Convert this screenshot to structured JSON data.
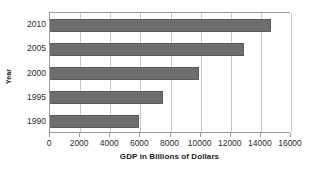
{
  "chart_data": {
    "type": "bar",
    "orientation": "horizontal",
    "title": "",
    "xlabel": "GDP in Billions of Dollars",
    "ylabel": "Year",
    "categories": [
      "2010",
      "2005",
      "2000",
      "1995",
      "1990"
    ],
    "values": [
      14700,
      12850,
      9900,
      7500,
      5900
    ],
    "series": [
      {
        "name": "GDP",
        "values": [
          14700,
          12850,
          9900,
          7500,
          5900
        ]
      }
    ],
    "xlim": [
      0,
      16000
    ],
    "xticks": [
      0,
      2000,
      4000,
      6000,
      8000,
      10000,
      12000,
      14000,
      16000
    ],
    "xtick_labels": [
      "0",
      "2000",
      "4000",
      "6000",
      "8000",
      "10000",
      "12000",
      "14000",
      "16000"
    ],
    "ytick_labels": [
      "2010",
      "2005",
      "2000",
      "1995",
      "1990"
    ],
    "grid": "vertical",
    "legend": "none",
    "bar_color": "#6e6e6e",
    "gridline_color": "#c8c8c8",
    "axis_color": "#9a9a9a",
    "background": "#ffffff"
  }
}
